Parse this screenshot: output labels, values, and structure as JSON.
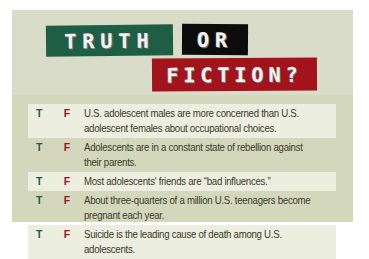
{
  "title": {
    "word1": "TRUTH",
    "word2": "OR",
    "word3": "FICTION?"
  },
  "colors": {
    "truth_green": "#1d5e44",
    "or_black": "#0c0c0c",
    "fiction_red": "#a3131c",
    "panel_bg": "#d3d8bd",
    "row_shade": "#eceedf"
  },
  "statements": [
    {
      "t": "T",
      "f": "F",
      "text": "U.S. adolescent males are more concerned than U.S. adolescent females about occupational choices."
    },
    {
      "t": "T",
      "f": "F",
      "text": "Adolescents are in a constant state of rebellion against their parents."
    },
    {
      "t": "T",
      "f": "F",
      "text": "Most adolescents' friends are “bad influences.”"
    },
    {
      "t": "T",
      "f": "F",
      "text": "About three-quarters of a million U.S. teenagers become pregnant each year."
    },
    {
      "t": "T",
      "f": "F",
      "text": "Suicide is the leading cause of death among U.S. adolescents."
    }
  ]
}
